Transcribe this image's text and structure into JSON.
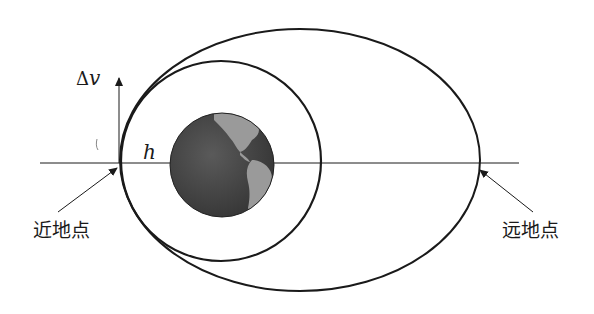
{
  "diagram": {
    "type": "orbit-transfer",
    "labels": {
      "perigee": "近地点",
      "apogee": "远地点",
      "delta_v": "Δv",
      "delta_v_symbol": "Δ",
      "delta_v_var": "v",
      "height": "h"
    },
    "elements": [
      {
        "id": "horizontal-axis",
        "kind": "line"
      },
      {
        "id": "circular-orbit",
        "kind": "circle",
        "note": "small inner orbit"
      },
      {
        "id": "elliptical-orbit",
        "kind": "ellipse",
        "note": "large transfer orbit"
      },
      {
        "id": "earth",
        "kind": "globe"
      },
      {
        "id": "delta-v-arrow",
        "kind": "arrow",
        "direction": "up"
      },
      {
        "id": "perigee-pointer",
        "kind": "arrow"
      },
      {
        "id": "apogee-pointer",
        "kind": "arrow"
      }
    ],
    "colors": {
      "stroke": "#1a1a1a",
      "earth_ocean": "#4a4a4a",
      "earth_land": "#9a9a9a",
      "background": "#ffffff"
    }
  }
}
